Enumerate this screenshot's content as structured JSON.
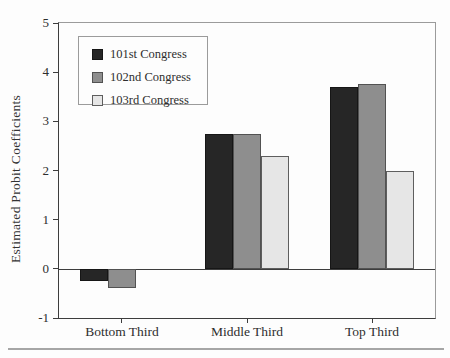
{
  "figure": {
    "background": "#fdfdfd",
    "bottom_rule_color": "#a6a6a6"
  },
  "chart_data": {
    "type": "bar",
    "title": "",
    "xlabel": "",
    "ylabel": "Estimated Probit Coefficients",
    "categories": [
      "Bottom Third",
      "Middle Third",
      "Top Third"
    ],
    "series": [
      {
        "name": "101st Congress",
        "values": [
          -0.25,
          2.75,
          3.7
        ],
        "color": "#262626",
        "border": "#161616"
      },
      {
        "name": "102nd Congress",
        "values": [
          -0.4,
          2.75,
          3.75
        ],
        "color": "#8e8e8e",
        "border": "#525252"
      },
      {
        "name": "103rd Congress",
        "values": [
          0,
          2.3,
          2.0
        ],
        "color": "#e6e6e6",
        "border": "#5e5e5e"
      }
    ],
    "ylim": [
      -1,
      5
    ],
    "yticks": [
      5,
      4,
      3,
      2,
      1,
      0,
      -1
    ],
    "grid": false,
    "zero_line": true,
    "legend_position": "upper-left-inside",
    "axis_color": "#3d3d3d",
    "frame_color": "#9b9b9b",
    "text_color": "#2e2e2e"
  }
}
